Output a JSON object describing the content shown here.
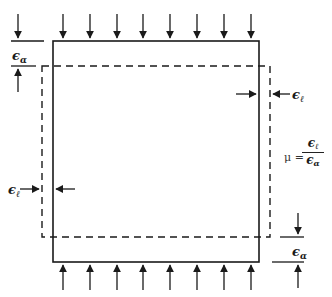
{
  "figure": {
    "colors": {
      "stroke": "#1a1a1a",
      "background": "#ffffff"
    }
  },
  "labels": {
    "axial_strain_top": {
      "symbol": "ϵ",
      "subscript": "α"
    },
    "axial_strain_bottom": {
      "symbol": "ϵ",
      "subscript": "α"
    },
    "lateral_strain_right": {
      "symbol": "ϵ",
      "subscript": "ℓ"
    },
    "lateral_strain_left": {
      "symbol": "ϵ",
      "subscript": "ℓ"
    },
    "poisson_formula": {
      "lhs": "μ =",
      "numerator_symbol": "ϵ",
      "numerator_subscript": "ℓ",
      "denominator_symbol": "ϵ",
      "denominator_subscript": "α"
    }
  },
  "shapes": {
    "original_square": {
      "style": "solid",
      "x": 53,
      "y": 41,
      "width": 206,
      "height": 221
    },
    "deformed_rect": {
      "style": "dashed",
      "x": 42,
      "y": 66,
      "width": 228,
      "height": 171
    },
    "load_arrow_x": [
      63,
      90,
      117,
      143,
      170,
      197,
      224,
      251
    ],
    "top_arrows_direction": "down",
    "bottom_arrows_direction": "up"
  }
}
